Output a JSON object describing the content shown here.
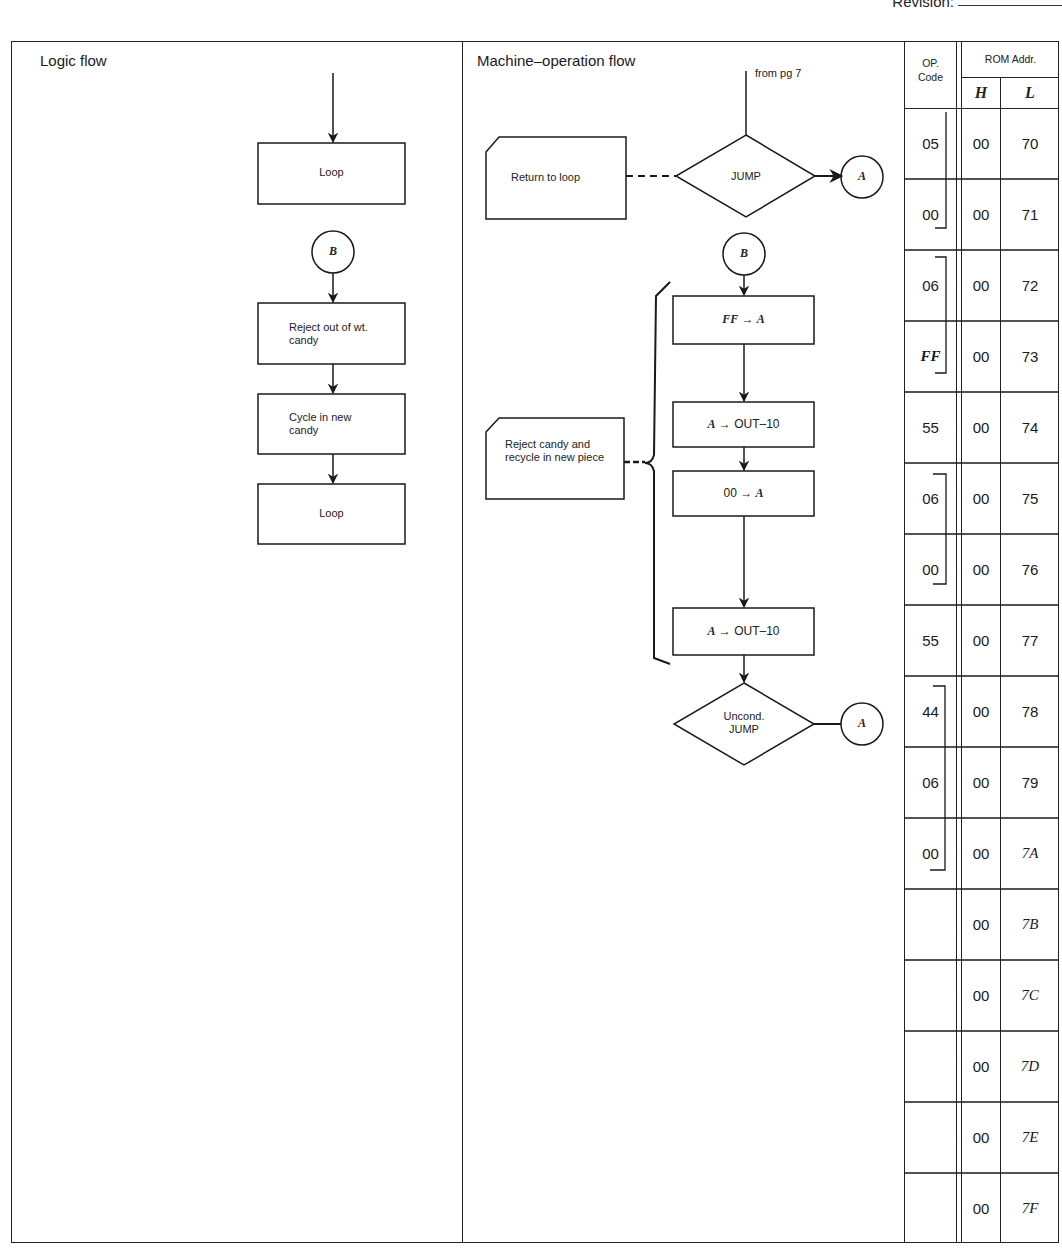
{
  "header": {
    "revision_label": "Revision:"
  },
  "logic_panel": {
    "title": "Logic flow",
    "boxes": [
      {
        "label": "Loop"
      },
      {
        "label": "Reject out of wt. candy"
      },
      {
        "label": "Cycle in new candy"
      },
      {
        "label": "Loop"
      }
    ],
    "connector_b": "B"
  },
  "machine_panel": {
    "title": "Machine–operation flow",
    "entry_note": "from pg 7",
    "decision_1": "JUMP",
    "connector_a1": "A",
    "connector_b": "B",
    "annotation_1": "Return to loop",
    "annotation_2": "Reject candy and recycle in new piece",
    "steps": [
      {
        "lhs": "FF",
        "arrow": "→",
        "rhs": "A"
      },
      {
        "lhs": "A",
        "arrow": "→",
        "rhs": "OUT–10"
      },
      {
        "lhs": "00",
        "arrow": "→",
        "rhs": "A"
      },
      {
        "lhs": "A",
        "arrow": "→",
        "rhs": "OUT–10"
      }
    ],
    "decision_2_line1": "Uncond.",
    "decision_2_line2": "JUMP",
    "connector_a2": "A"
  },
  "table": {
    "op_header_line1": "OP.",
    "op_header_line2": "Code",
    "rom_header": "ROM Addr.",
    "h_header": "H",
    "l_header": "L",
    "rows": [
      {
        "op": "05",
        "h": "00",
        "l": "70"
      },
      {
        "op": "00",
        "h": "00",
        "l": "71"
      },
      {
        "op": "06",
        "h": "00",
        "l": "72"
      },
      {
        "op": "FF",
        "h": "00",
        "l": "73"
      },
      {
        "op": "55",
        "h": "00",
        "l": "74"
      },
      {
        "op": "06",
        "h": "00",
        "l": "75"
      },
      {
        "op": "00",
        "h": "00",
        "l": "76"
      },
      {
        "op": "55",
        "h": "00",
        "l": "77"
      },
      {
        "op": "44",
        "h": "00",
        "l": "78"
      },
      {
        "op": "06",
        "h": "00",
        "l": "79"
      },
      {
        "op": "00",
        "h": "00",
        "l": "7A"
      },
      {
        "op": "",
        "h": "00",
        "l": "7B"
      },
      {
        "op": "",
        "h": "00",
        "l": "7C"
      },
      {
        "op": "",
        "h": "00",
        "l": "7D"
      },
      {
        "op": "",
        "h": "00",
        "l": "7E"
      },
      {
        "op": "",
        "h": "00",
        "l": "7F"
      }
    ]
  }
}
